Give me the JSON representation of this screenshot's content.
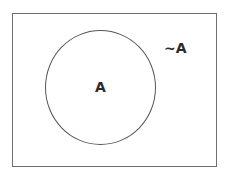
{
  "diagram": {
    "type": "venn",
    "universe": {
      "shape": "rectangle",
      "border_color": "#6e6e6e"
    },
    "sets": [
      {
        "name": "A",
        "label": "A",
        "shape": "circle"
      }
    ],
    "complement_label": "~A"
  }
}
